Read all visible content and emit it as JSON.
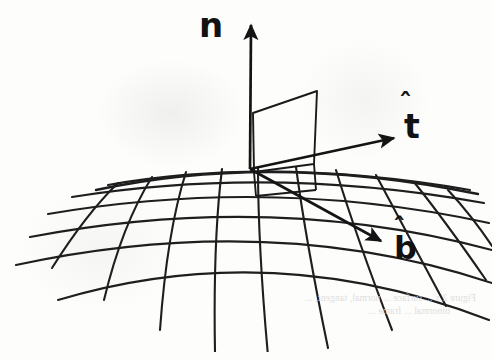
{
  "figure": {
    "background_color": "#fdfdfc",
    "ink_color": "#1a1a1a",
    "medium": "scanned book page"
  },
  "vectors": [
    {
      "id": "normal",
      "label": "n",
      "accent": "̂",
      "full_label": "n̂",
      "description": "unit normal vector",
      "tail": [
        250,
        169
      ],
      "tip": [
        251,
        21
      ],
      "color": "#141414"
    },
    {
      "id": "tangent",
      "label": "t",
      "accent": "̂",
      "full_label": "t̂",
      "description": "unit tangent vector",
      "tail": [
        250,
        169
      ],
      "tip": [
        399,
        136
      ],
      "color": "#141414"
    },
    {
      "id": "binormal",
      "label": "b",
      "accent": "̂",
      "full_label": "b̂",
      "description": "unit binormal vector",
      "tail": [
        250,
        169
      ],
      "tip": [
        386,
        244
      ],
      "color": "#141414"
    }
  ],
  "normal_plane_panel": {
    "description": "quadrilateral panel spanned by the normal and tangent directions",
    "points": "253,113 317,91 314,164 254,172"
  },
  "surface": {
    "description": "dome-shaped parametric surface drawn as a wireframe mesh",
    "latitude_line_count": 6,
    "longitude_line_count": 10,
    "horizon_apex": [
      272,
      166
    ],
    "stroke_width": 2.1
  },
  "ghost_caption": {
    "visible": true,
    "description": "faint show-through of caption text printed on the reverse side of the page",
    "line1": "Figure 2.x  ...  surface  ...  normal, tangent,  ...",
    "line2": "binormal  ...  frame  ..."
  }
}
